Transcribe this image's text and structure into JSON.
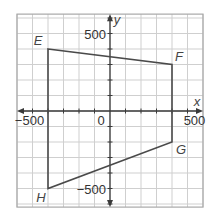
{
  "chart_data": {
    "type": "scatter",
    "title": "",
    "xlabel": "x",
    "ylabel": "y",
    "xlim": [
      -600,
      600
    ],
    "ylim": [
      -620,
      625
    ],
    "grid": true,
    "grid_step": 100,
    "tick_labels": {
      "x": [
        {
          "value": -500,
          "label": "−500"
        },
        {
          "value": 500,
          "label": "500"
        }
      ],
      "y": [
        {
          "value": 500,
          "label": "500"
        },
        {
          "value": -500,
          "label": "−500"
        }
      ],
      "origin": "0"
    },
    "shapes": [
      {
        "type": "polygon",
        "name": "EFGH",
        "vertices": [
          {
            "label": "E",
            "x": -400,
            "y": 400
          },
          {
            "label": "F",
            "x": 400,
            "y": 300
          },
          {
            "label": "G",
            "x": 400,
            "y": -200
          },
          {
            "label": "H",
            "x": -400,
            "y": -500
          }
        ]
      }
    ]
  },
  "colors": {
    "grid": "#cfcfcf",
    "border": "#a8a8a8",
    "axis": "#3a3a3a",
    "shape": "#4a4a4a",
    "label": "#333333"
  }
}
